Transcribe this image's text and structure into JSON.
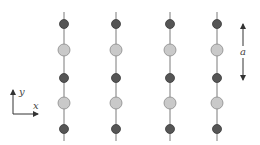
{
  "diagram": {
    "title": "",
    "colors": {
      "line": "#7a7a7a",
      "dark_atom_fill": "#555555",
      "dark_atom_stroke": "#3a3a3a",
      "light_atom_fill": "#c9c9c9",
      "light_atom_stroke": "#8a8a8a",
      "arrow": "#333333",
      "label": "#444444"
    },
    "chains": [
      {
        "x": 64
      },
      {
        "x": 116
      },
      {
        "x": 170
      },
      {
        "x": 217
      }
    ],
    "chain_line": {
      "y_start": 12,
      "y_end": 141
    },
    "atoms": [
      {
        "y": 24,
        "type": "dark"
      },
      {
        "y": 50,
        "type": "light"
      },
      {
        "y": 78,
        "type": "dark"
      },
      {
        "y": 103,
        "type": "light"
      },
      {
        "y": 129,
        "type": "dark"
      }
    ],
    "atom_radius": {
      "dark": 4.5,
      "light": 6
    },
    "axes": {
      "origin": {
        "x": 13,
        "y": 114
      },
      "y_end": 90,
      "x_end": 38,
      "y_label": "y",
      "x_label": "x"
    },
    "spacing_arrow": {
      "x": 243,
      "y_top": 24,
      "y_bottom": 80,
      "label": "a"
    }
  }
}
